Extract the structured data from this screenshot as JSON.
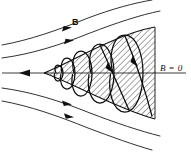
{
  "figure": {
    "type": "physics-diagram",
    "background_color": "#ffffff",
    "line_color": "#1a1a1a",
    "hatch_color": "#222222"
  },
  "labels": {
    "field_label": "B",
    "field_label_x": 72,
    "field_label_y": 18,
    "zero_field_label": "B = 0",
    "zero_field_label_x": 160,
    "zero_field_label_y": 64
  },
  "axis": {
    "name": "horizontal-axis",
    "y": 73,
    "x_start": 2,
    "x_end": 186,
    "arrow_x": 26,
    "arrow_direction": "left"
  },
  "cone": {
    "name": "hatched-flux-cone",
    "apex_x": 44,
    "apex_y": 73,
    "right_x": 155,
    "top_y": 27,
    "bottom_y": 119,
    "hatch_angle_deg": -45,
    "hatch_spacing": 4
  },
  "field_lines": [
    {
      "id": "upper-outer",
      "arrow_t": 0.46
    },
    {
      "id": "upper-inner",
      "arrow_t": 0.48
    },
    {
      "id": "lower-inner",
      "arrow_t": 0.46
    },
    {
      "id": "lower-outer",
      "arrow_t": 0.5
    }
  ],
  "helix": {
    "name": "particle-helical-trajectory",
    "loops": 5,
    "arrow_count": 2,
    "direction": "rightward-expanding"
  }
}
